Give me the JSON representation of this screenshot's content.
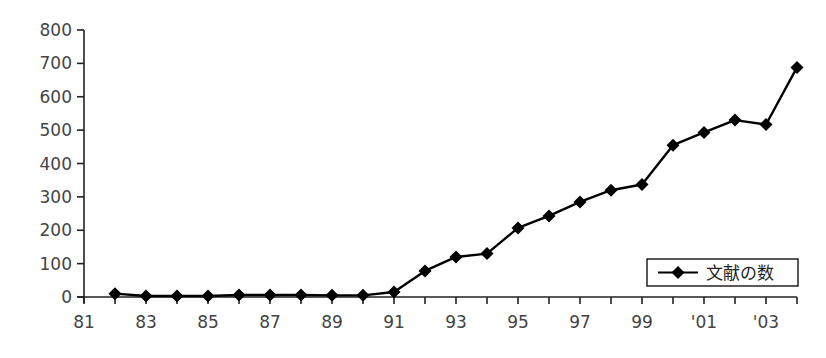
{
  "chart_data": {
    "type": "line",
    "title": "",
    "xlabel": "",
    "ylabel": "",
    "ylim": [
      0,
      800
    ],
    "yticks": [
      0,
      100,
      200,
      300,
      400,
      500,
      600,
      700,
      800
    ],
    "xtick_labels": [
      "81",
      "83",
      "85",
      "87",
      "89",
      "91",
      "93",
      "95",
      "97",
      "99",
      "'01",
      "'03"
    ],
    "grid": false,
    "legend_position": "lower right",
    "x": [
      "82",
      "83",
      "84",
      "85",
      "86",
      "87",
      "88",
      "89",
      "90",
      "91",
      "92",
      "93",
      "94",
      "95",
      "96",
      "97",
      "98",
      "99",
      "'00",
      "'01",
      "'02",
      "'03",
      "'04"
    ],
    "series": [
      {
        "name": "文献の数",
        "marker": "diamond",
        "color": "#000000",
        "values": [
          10,
          3,
          3,
          3,
          6,
          6,
          6,
          5,
          5,
          15,
          78,
          120,
          130,
          207,
          243,
          285,
          320,
          337,
          455,
          493,
          530,
          517,
          688
        ]
      }
    ]
  },
  "legend": {
    "label": "文献の数"
  }
}
